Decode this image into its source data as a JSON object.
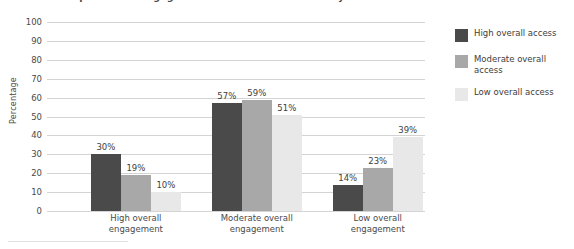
{
  "figure": {
    "title": "Relationship between Engagement and Access to Flexibility",
    "title_clipped": true
  },
  "chart_data": {
    "type": "bar",
    "title": "Relationship between Engagement and Access to Flexibility",
    "xlabel": "",
    "ylabel": "Percentage",
    "ylim": [
      0,
      100
    ],
    "ytick_step": 10,
    "grid": true,
    "legend_position": "right",
    "value_suffix": "%",
    "categories": [
      "High overall engagement",
      "Moderate overall engagement",
      "Low overall engagement"
    ],
    "yticks": [
      "100",
      "90",
      "80",
      "70",
      "60",
      "50",
      "40",
      "30",
      "20",
      "10",
      "0"
    ],
    "series": [
      {
        "name": "High overall access",
        "color": "#4a4a4a",
        "values": [
          30,
          57,
          14
        ],
        "labels": [
          "30%",
          "57%",
          "14%"
        ]
      },
      {
        "name": "Moderate overall access",
        "color": "#a8a8a8",
        "values": [
          19,
          59,
          23
        ],
        "labels": [
          "19%",
          "59%",
          "23%"
        ]
      },
      {
        "name": "Low overall access",
        "color": "#e8e8e8",
        "values": [
          10,
          51,
          39
        ],
        "labels": [
          "10%",
          "51%",
          "39%"
        ]
      }
    ]
  },
  "axis": {
    "y_title": "Percentage"
  },
  "colors": {
    "gridline": "#d4d4d4",
    "text": "#3d3d3d",
    "series_dark": "#4a4a4a",
    "series_medium": "#a8a8a8",
    "series_light": "#e8e8e8"
  },
  "category_lines": [
    [
      "High overall",
      "engagement"
    ],
    [
      "Moderate overall",
      "engagement"
    ],
    [
      "Low overall",
      "engagement"
    ]
  ]
}
